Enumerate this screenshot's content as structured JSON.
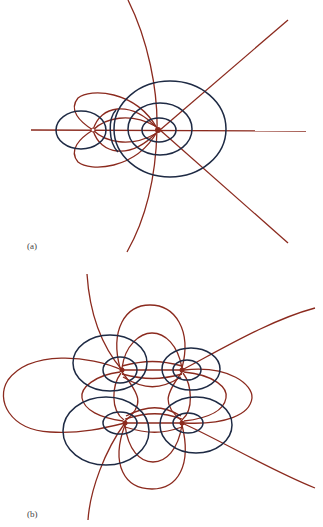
{
  "figure": {
    "panels": [
      {
        "id": "a",
        "label": "(a)"
      },
      {
        "id": "b",
        "label": "(b)"
      }
    ],
    "colors": {
      "field_lines": "#8b2a1e",
      "equipotentials": "#1e2a44",
      "background": "#ffffff"
    }
  }
}
